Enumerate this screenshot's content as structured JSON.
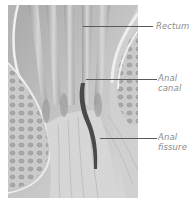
{
  "figure": {
    "type": "anatomical-illustration",
    "palette": {
      "background": "#ffffff",
      "tissue_light": "#e4e4e4",
      "tissue_mid": "#b8b8b8",
      "tissue_dark": "#8c8c8c",
      "fissure": "#4a4a4a",
      "fat_cells": "#a9a9a9",
      "label_text": "#8a8a8a",
      "leader_line": "#5a5a5a"
    },
    "labels": [
      {
        "id": "rectum",
        "line1": "Rectum",
        "line2": ""
      },
      {
        "id": "anal-canal",
        "line1": "Anal",
        "line2": "canal"
      },
      {
        "id": "anal-fissure",
        "line1": "Anal",
        "line2": "fissure"
      }
    ]
  }
}
